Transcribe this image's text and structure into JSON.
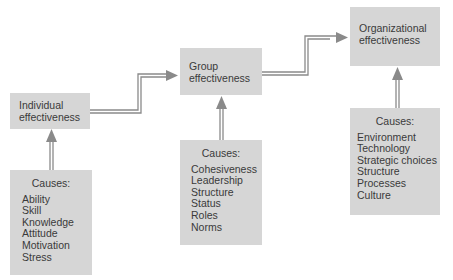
{
  "diagram": {
    "levels": [
      {
        "outcome": [
          "Individual",
          "effectiveness"
        ],
        "causes_title": "Causes:",
        "causes": [
          "Ability",
          "Skill",
          "Knowledge",
          "Attitude",
          "Motivation",
          "Stress"
        ]
      },
      {
        "outcome": [
          "Group",
          "effectiveness"
        ],
        "causes_title": "Causes:",
        "causes": [
          "Cohesiveness",
          "Leadership",
          "Structure",
          "Status",
          "Roles",
          "Norms"
        ]
      },
      {
        "outcome": [
          "Organizational",
          "effectiveness"
        ],
        "causes_title": "Causes:",
        "causes": [
          "Environment",
          "Technology",
          "Strategic choices",
          "Structure",
          "Processes",
          "Culture"
        ]
      }
    ],
    "colors": {
      "box": "#d6d6d6",
      "arrow": "#8a8a8a",
      "text": "#3a3a3a"
    }
  }
}
